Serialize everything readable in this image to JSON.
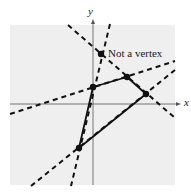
{
  "figure": {
    "axis_labels": {
      "x": "x",
      "y": "y"
    },
    "annotation": "Not a vertex",
    "colors": {
      "background": "#ffffff",
      "plot_area": "#efefef",
      "ink": "#111111",
      "axis": "#555555"
    },
    "vertices": [
      {
        "name": "vertex-upper-left",
        "x": 93,
        "y": 87
      },
      {
        "name": "vertex-top",
        "x": 127,
        "y": 77
      },
      {
        "name": "vertex-right",
        "x": 146,
        "y": 94
      },
      {
        "name": "vertex-bottom",
        "x": 79,
        "y": 148
      }
    ],
    "non_vertex_point": {
      "x": 101,
      "y": 54
    },
    "polygon_edges": [
      [
        93,
        87,
        127,
        77
      ],
      [
        127,
        77,
        146,
        94
      ],
      [
        146,
        94,
        79,
        148
      ],
      [
        79,
        148,
        93,
        87
      ]
    ],
    "boundary_lines_dashed": [
      {
        "name": "line-steep-through-nonvertex",
        "x1": 110,
        "y1": 24,
        "x2": 71,
        "y2": 186
      },
      {
        "name": "line-descending",
        "x1": 68,
        "y1": 25,
        "x2": 175,
        "y2": 118
      },
      {
        "name": "line-shallow-rising",
        "x1": 10,
        "y1": 114,
        "x2": 175,
        "y2": 61
      },
      {
        "name": "line-steep-rising",
        "x1": 31,
        "y1": 186,
        "x2": 175,
        "y2": 70
      }
    ]
  }
}
